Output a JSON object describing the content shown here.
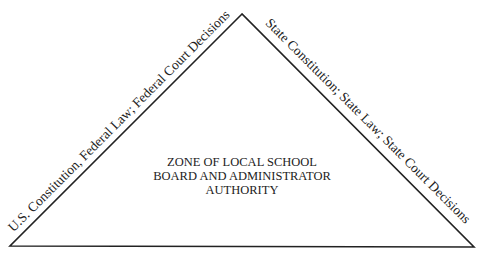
{
  "diagram": {
    "type": "triangle",
    "left_side_label": "U.S. Constitution, Federal Law; Federal Court Decisions",
    "right_side_label": "State Constitution; State Law; State Court Decisions",
    "center_label": {
      "line1": "ZONE OF LOCAL SCHOOL",
      "line2": "BOARD AND ADMINISTRATOR",
      "line3": "AUTHORITY"
    },
    "stroke_color": "#222222"
  }
}
